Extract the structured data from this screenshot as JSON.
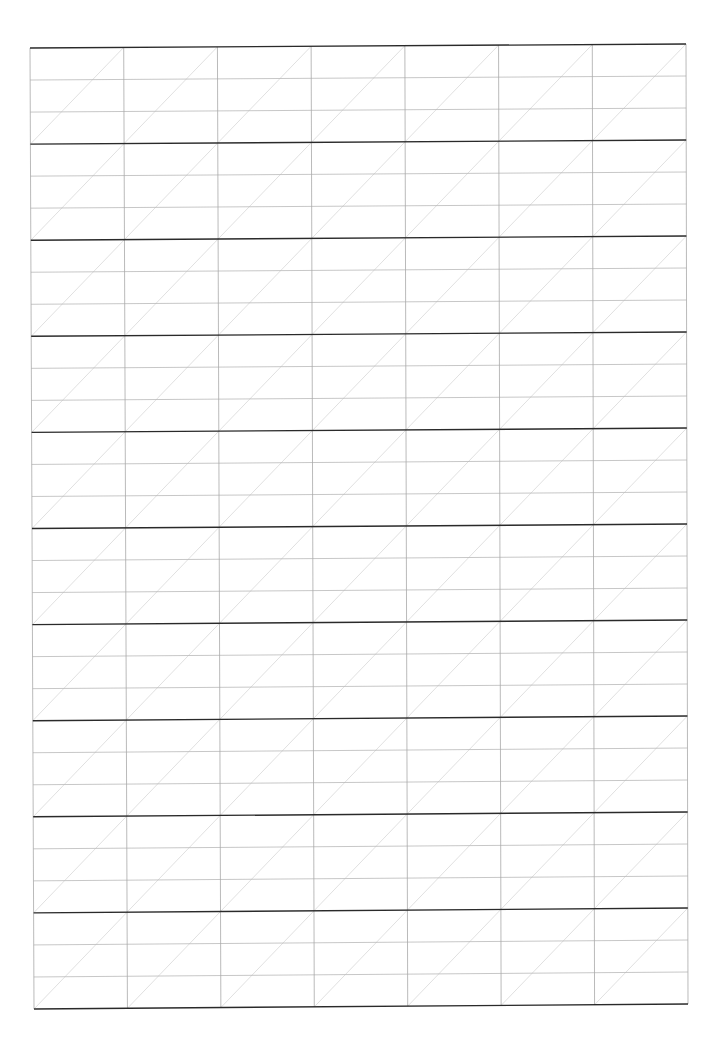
{
  "page": {
    "width": 720,
    "height": 1046,
    "background": "#ffffff"
  },
  "grid": {
    "type": "handwriting-practice-grid",
    "corners": {
      "top_left": [
        30,
        48
      ],
      "top_right": [
        686,
        44
      ],
      "bottom_left": [
        34,
        1009
      ],
      "bottom_right": [
        688,
        1004
      ]
    },
    "columns": 7,
    "bands": 10,
    "subdivisions_per_band": 3,
    "colors": {
      "thick_line": "#2a2a2a",
      "thin_line": "#b9b9b9",
      "vertical_line": "#a8a8a8",
      "diagonal_line": "#d2d2d2"
    },
    "stroke_widths": {
      "thick": 1.4,
      "thin": 0.8,
      "vertical": 0.8,
      "diagonal": 0.7
    }
  }
}
